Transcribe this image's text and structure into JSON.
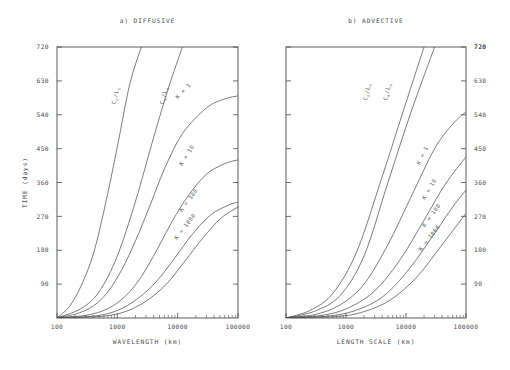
{
  "figure": {
    "background": "#ffffff",
    "ink": "#4a4a4a",
    "width": 510,
    "height": 370
  },
  "panels": [
    {
      "id": "a",
      "title": "a) DIFFUSIVE",
      "xlabel": "WAVELENGTH (km)",
      "ylabel": "TIME (days)",
      "ylabel_side": "left",
      "ytick_side": "left"
    },
    {
      "id": "b",
      "title": "b) ADVECTIVE",
      "xlabel": "LENGTH SCALE (km)",
      "ylabel": "",
      "ylabel_side": "right",
      "ytick_side": "right"
    }
  ],
  "chart_data": [
    {
      "type": "line",
      "title": "a) DIFFUSIVE",
      "xlabel": "WAVELENGTH (km)",
      "ylabel": "TIME (days)",
      "xscale": "log",
      "yscale": "linear",
      "xlim": [
        100,
        100000
      ],
      "ylim": [
        0,
        720
      ],
      "xticks": [
        100,
        1000,
        10000,
        100000
      ],
      "xticklabels": [
        "100",
        "1000",
        "10000",
        "100000"
      ],
      "yticks": [
        90,
        180,
        270,
        360,
        450,
        540,
        630,
        720
      ],
      "yticklabels": [
        "90",
        "180",
        "270",
        "360",
        "450",
        "540",
        "630",
        "720"
      ],
      "grid": false,
      "legend": "inline-curve-labels",
      "series": [
        {
          "name": "C_o/L_o",
          "label": "C_o/L_o",
          "label_x": 1000,
          "label_y": 590,
          "x": [
            100,
            160,
            250,
            400,
            630,
            1000,
            1600,
            2500
          ],
          "y": [
            0,
            30,
            85,
            170,
            300,
            455,
            620,
            720
          ]
        },
        {
          "name": "C_a/L_a",
          "label": "C_a/L_a",
          "label_x": 6300,
          "label_y": 590,
          "x": [
            100,
            250,
            500,
            1000,
            2000,
            4000,
            7000,
            12000
          ],
          "y": [
            0,
            25,
            70,
            165,
            310,
            480,
            610,
            720
          ]
        },
        {
          "name": "K = 1",
          "label": "K = 1",
          "label_x": 13000,
          "label_y": 600,
          "x": [
            100,
            200,
            400,
            700,
            1200,
            2000,
            3500,
            6000,
            12000,
            30000,
            60000,
            100000
          ],
          "y": [
            2,
            10,
            32,
            70,
            130,
            205,
            300,
            395,
            490,
            558,
            582,
            590
          ]
        },
        {
          "name": "K = 10",
          "label": "K = 10",
          "label_x": 15000,
          "label_y": 430,
          "x": [
            100,
            300,
            700,
            1400,
            2500,
            4500,
            8000,
            15000,
            30000,
            60000,
            100000
          ],
          "y": [
            1,
            7,
            25,
            60,
            110,
            180,
            255,
            325,
            382,
            410,
            420
          ]
        },
        {
          "name": "K = 100",
          "label": "K = 100",
          "label_x": 16000,
          "label_y": 310,
          "x": [
            100,
            400,
            1000,
            2200,
            4500,
            9000,
            18000,
            36000,
            70000,
            100000
          ],
          "y": [
            1,
            5,
            20,
            52,
            98,
            160,
            225,
            275,
            300,
            308
          ]
        },
        {
          "name": "K = 1000",
          "label": "K = 1000",
          "label_x": 14000,
          "label_y": 240,
          "x": [
            100,
            500,
            1300,
            3000,
            6500,
            13000,
            26000,
            52000,
            100000
          ],
          "y": [
            1,
            4,
            16,
            45,
            90,
            150,
            212,
            265,
            295
          ]
        }
      ]
    },
    {
      "type": "line",
      "title": "b) ADVECTIVE",
      "xlabel": "LENGTH SCALE (km)",
      "ylabel": "TIME (days)",
      "xscale": "log",
      "yscale": "linear",
      "xlim": [
        100,
        100000
      ],
      "ylim": [
        0,
        720
      ],
      "xticks": [
        100,
        1000,
        10000,
        100000
      ],
      "xticklabels": [
        "100",
        "1000",
        "10000",
        "100000"
      ],
      "yticks": [
        90,
        180,
        270,
        360,
        450,
        540,
        630,
        720
      ],
      "yticklabels": [
        "90",
        "180",
        "270",
        "360",
        "450",
        "540",
        "630",
        "720"
      ],
      "grid": false,
      "legend": "inline-curve-labels",
      "series": [
        {
          "name": "C_o/L_o",
          "label": "C_o/L_o",
          "label_x": 2400,
          "label_y": 600,
          "x": [
            100,
            250,
            600,
            1500,
            4000,
            9000,
            20000
          ],
          "y": [
            0,
            20,
            65,
            175,
            375,
            550,
            720
          ]
        },
        {
          "name": "C_a/L_a",
          "label": "C_a/L_a",
          "label_x": 5200,
          "label_y": 600,
          "x": [
            100,
            300,
            800,
            2000,
            5000,
            12000,
            30000
          ],
          "y": [
            0,
            18,
            60,
            165,
            360,
            545,
            720
          ]
        },
        {
          "name": "K = 1",
          "label": "K = 1",
          "label_x": 20000,
          "label_y": 430,
          "x": [
            100,
            300,
            800,
            2000,
            5000,
            12000,
            30000,
            60000,
            100000
          ],
          "y": [
            1,
            9,
            35,
            90,
            195,
            320,
            450,
            515,
            548
          ]
        },
        {
          "name": "K = 10",
          "label": "K = 10",
          "label_x": 26000,
          "label_y": 340,
          "x": [
            100,
            400,
            1100,
            3000,
            8000,
            20000,
            45000,
            100000
          ],
          "y": [
            1,
            7,
            27,
            72,
            155,
            260,
            355,
            428
          ]
        },
        {
          "name": "K = 100",
          "label": "K = 100",
          "label_x": 28000,
          "label_y": 270,
          "x": [
            100,
            500,
            1500,
            4200,
            11000,
            28000,
            60000,
            100000
          ],
          "y": [
            1,
            5,
            21,
            58,
            128,
            218,
            295,
            340
          ]
        },
        {
          "name": "K = 1000",
          "label": "K = 1000",
          "label_x": 26000,
          "label_y": 210,
          "x": [
            100,
            700,
            2000,
            5500,
            15000,
            38000,
            75000,
            100000
          ],
          "y": [
            1,
            4,
            17,
            48,
            108,
            190,
            252,
            278
          ]
        }
      ]
    }
  ]
}
